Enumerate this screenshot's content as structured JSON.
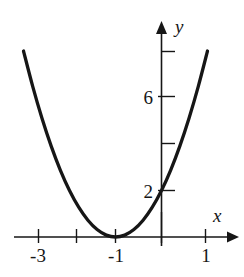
{
  "figure": {
    "kind": "math-graph",
    "background_color": "#ffffff",
    "ink_color": "#161616",
    "curve_color": "#161616"
  },
  "axes": {
    "x_axis_label": "x",
    "y_axis_label": "y",
    "x_tick_labels": [
      "-3",
      "-1",
      "1"
    ],
    "y_tick_labels": [
      "6",
      "2"
    ]
  },
  "chart_data": {
    "type": "line",
    "title": "",
    "subtitle": "",
    "xlabel": "x",
    "ylabel": "y",
    "xlim": [
      -3.6,
      1.6
    ],
    "ylim": [
      -0.9,
      9.6
    ],
    "grid": false,
    "legend": null,
    "equation": "y = 2(x + 1)^2",
    "vertex": [
      -1,
      0
    ],
    "y_intercept": [
      0,
      2
    ],
    "x_ticks": [
      -3,
      -2,
      -1,
      0,
      1
    ],
    "x_tick_labels_shown": {
      "-3": "-3",
      "-1": "-1",
      "1": "1"
    },
    "y_ticks": [
      2,
      4,
      6,
      8
    ],
    "y_tick_labels_shown": {
      "2": "2",
      "6": "6"
    },
    "series": [
      {
        "name": "parabola",
        "x": [
          -3.0,
          -2.8,
          -2.6,
          -2.4,
          -2.2,
          -2.0,
          -1.8,
          -1.6,
          -1.4,
          -1.2,
          -1.0,
          -0.8,
          -0.6,
          -0.4,
          -0.2,
          0.0,
          0.2,
          0.4,
          0.6,
          0.8,
          1.0
        ],
        "y": [
          8.0,
          6.48,
          5.12,
          3.92,
          2.88,
          2.0,
          1.28,
          0.72,
          0.32,
          0.08,
          0.0,
          0.08,
          0.32,
          0.72,
          1.28,
          2.0,
          2.88,
          3.92,
          5.12,
          6.48,
          8.0
        ]
      }
    ]
  }
}
